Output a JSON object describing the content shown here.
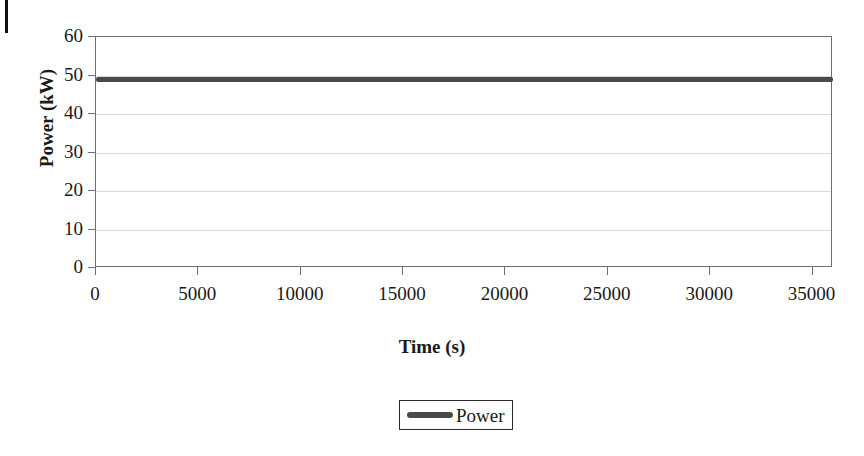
{
  "artifacts": {
    "scan_edge_mark": "page-edge-scan-artifact"
  },
  "chart_data": {
    "type": "line",
    "title": "",
    "subtitle": "",
    "xlabel": "Time (s)",
    "ylabel": "Power (kW)",
    "xlim": [
      0,
      36000
    ],
    "ylim": [
      0,
      60
    ],
    "grid": true,
    "grid_axis": "y",
    "legend_position": "bottom-center",
    "x_ticks": [
      0,
      5000,
      10000,
      15000,
      20000,
      25000,
      30000,
      35000
    ],
    "x_tick_labels": [
      "0",
      "5000",
      "10000",
      "15000",
      "20000",
      "25000",
      "30000",
      "35000"
    ],
    "y_ticks": [
      0,
      10,
      20,
      30,
      40,
      50,
      60
    ],
    "y_tick_labels": [
      "0",
      "10",
      "20",
      "30",
      "40",
      "50",
      "60"
    ],
    "series": [
      {
        "name": "Power",
        "color": "#4a4a4a",
        "line_width_px": 5,
        "x": [
          0,
          2000,
          4000,
          6000,
          8000,
          10000,
          12000,
          14000,
          16000,
          18000,
          20000,
          22000,
          24000,
          26000,
          28000,
          30000,
          32000,
          34000,
          36000
        ],
        "values": [
          49,
          49,
          49,
          49,
          49,
          49,
          49,
          49,
          49,
          49,
          49,
          49,
          49,
          49,
          49,
          49,
          49,
          49,
          49
        ]
      }
    ],
    "legend": [
      {
        "label": "Power",
        "color": "#4a4a4a"
      }
    ],
    "annotations": []
  }
}
